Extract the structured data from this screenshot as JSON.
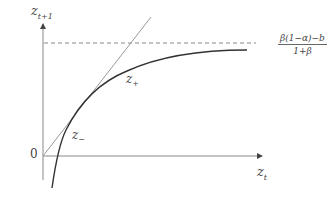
{
  "diagram": {
    "type": "phase diagram",
    "y_axis_label": {
      "base": "z",
      "sub": "t+1"
    },
    "x_axis_label": {
      "base": "z",
      "sub": "t"
    },
    "origin_label": "0",
    "asymptote_label": {
      "numerator": "β(1−α)−b",
      "denominator": "1+β"
    },
    "fixed_points": [
      {
        "base": "z",
        "sub": "+",
        "name": "upper-fixed-point"
      },
      {
        "base": "z",
        "sub": "−",
        "name": "lower-fixed-point"
      }
    ],
    "elements": [
      "45-degree line",
      "concave map curve",
      "dashed horizontal asymptote"
    ],
    "colors": {
      "axes": "#777777",
      "curve": "#333333",
      "diagonal": "#999999",
      "dashed": "#888888",
      "text": "#444444"
    }
  }
}
